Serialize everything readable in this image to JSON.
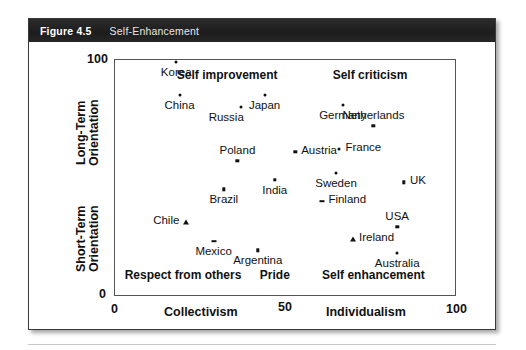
{
  "figure": {
    "number": "Figure 4.5",
    "title": "Self-Enhancement"
  },
  "chart_data": {
    "type": "scatter",
    "title": "Self-Enhancement",
    "xlabel": "Collectivism — Individualism",
    "ylabel": "Short-Term Orientation — Long-Term Orientation",
    "xlim": [
      0,
      100
    ],
    "ylim": [
      0,
      100
    ],
    "xticks": [
      "0",
      "50",
      "100"
    ],
    "yticks": [
      "0",
      "100"
    ],
    "grid": false,
    "legend": "none",
    "axis_labels": {
      "x_left": "Collectivism",
      "x_right": "Individualism",
      "y_top": "Long-Term\nOrientation",
      "y_bottom": "Short-Term\nOrientation"
    },
    "quadrant_labels": [
      {
        "text": "Self improvement",
        "x": 33,
        "y": 93
      },
      {
        "text": "Self criticism",
        "x": 75,
        "y": 93
      },
      {
        "text": "Respect from others",
        "x": 20,
        "y": 8
      },
      {
        "text": "Pride",
        "x": 47,
        "y": 8
      },
      {
        "text": "Self enhancement",
        "x": 76,
        "y": 8
      }
    ],
    "points": [
      {
        "name": "Korea",
        "x": 18,
        "y": 99,
        "marker": "dot",
        "label_pos": "below"
      },
      {
        "name": "China",
        "x": 19,
        "y": 85,
        "marker": "dot",
        "label_pos": "below"
      },
      {
        "name": "Japan",
        "x": 44,
        "y": 85,
        "marker": "dot",
        "label_pos": "below"
      },
      {
        "name": "Russia",
        "x": 37,
        "y": 80,
        "marker": "dot",
        "label_pos": "below-left"
      },
      {
        "name": "Germany",
        "x": 67,
        "y": 81,
        "marker": "dot",
        "label_pos": "below"
      },
      {
        "name": "Netherlands",
        "x": 76,
        "y": 72,
        "marker": "square",
        "label_pos": "above"
      },
      {
        "name": "Poland",
        "x": 36,
        "y": 57,
        "marker": "square",
        "label_pos": "above"
      },
      {
        "name": "Austria",
        "x": 53,
        "y": 61,
        "marker": "square",
        "label_pos": "right"
      },
      {
        "name": "France",
        "x": 66,
        "y": 62,
        "marker": "dot",
        "label_pos": "right"
      },
      {
        "name": "Sweden",
        "x": 65,
        "y": 52,
        "marker": "dot",
        "label_pos": "below"
      },
      {
        "name": "UK",
        "x": 85,
        "y": 48,
        "marker": "square",
        "label_pos": "right"
      },
      {
        "name": "India",
        "x": 47,
        "y": 49,
        "marker": "square",
        "label_pos": "below"
      },
      {
        "name": "Brazil",
        "x": 32,
        "y": 45,
        "marker": "square",
        "label_pos": "below"
      },
      {
        "name": "Finland",
        "x": 61,
        "y": 40,
        "marker": "dash",
        "label_pos": "right"
      },
      {
        "name": "USA",
        "x": 83,
        "y": 29,
        "marker": "square",
        "label_pos": "above"
      },
      {
        "name": "Chile",
        "x": 21,
        "y": 31,
        "marker": "tri",
        "label_pos": "left"
      },
      {
        "name": "Ireland",
        "x": 70,
        "y": 24,
        "marker": "tri",
        "label_pos": "right"
      },
      {
        "name": "Mexico",
        "x": 29,
        "y": 23,
        "marker": "dash",
        "label_pos": "below"
      },
      {
        "name": "Argentina",
        "x": 42,
        "y": 19,
        "marker": "square",
        "label_pos": "below"
      },
      {
        "name": "Australia",
        "x": 83,
        "y": 18,
        "marker": "dot",
        "label_pos": "below"
      }
    ]
  }
}
